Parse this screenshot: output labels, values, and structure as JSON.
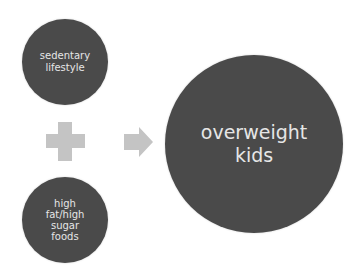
{
  "diagram": {
    "inputs": [
      {
        "label": "sedentary lifestyle",
        "lines": [
          "sedentary",
          "lifestyle"
        ]
      },
      {
        "label": "high fat/high sugar foods",
        "lines": [
          "high",
          "fat/high",
          "sugar",
          "foods"
        ]
      }
    ],
    "operator": "plus-icon",
    "connector": "arrow-right-icon",
    "result": {
      "label": "overweight kids",
      "lines": [
        "overweight",
        "kids"
      ]
    }
  },
  "colors": {
    "circle_fill": "#4a4a4a",
    "circle_text": "#e6e6e6",
    "symbol_fill": "#c4c4c4",
    "background": "#ffffff"
  }
}
